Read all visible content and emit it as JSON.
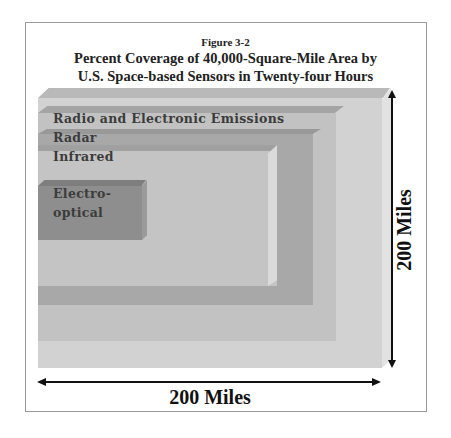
{
  "figure": {
    "label": "Figure 3-2",
    "title_line1": "Percent Coverage of 40,000-Square-Mile Area by",
    "title_line2": "U.S. Space-based Sensors in Twenty-four Hours"
  },
  "layers": [
    {
      "name": "total-area",
      "label": "",
      "color": "#d2d2d2"
    },
    {
      "name": "radio-electronic",
      "label": "Radio and Electronic Emissions",
      "color": "#c2c2c2"
    },
    {
      "name": "radar",
      "label": "Radar",
      "color": "#a8a8a8"
    },
    {
      "name": "infrared",
      "label": "Infrared",
      "color": "#c4c4c4"
    },
    {
      "name": "electro-optical",
      "label": "Electro-\noptical",
      "label_line1": "Electro-",
      "label_line2": "optical",
      "color": "#8e8e8e"
    }
  ],
  "dimensions": {
    "width_label": "200 Miles",
    "height_label": "200 Miles"
  }
}
